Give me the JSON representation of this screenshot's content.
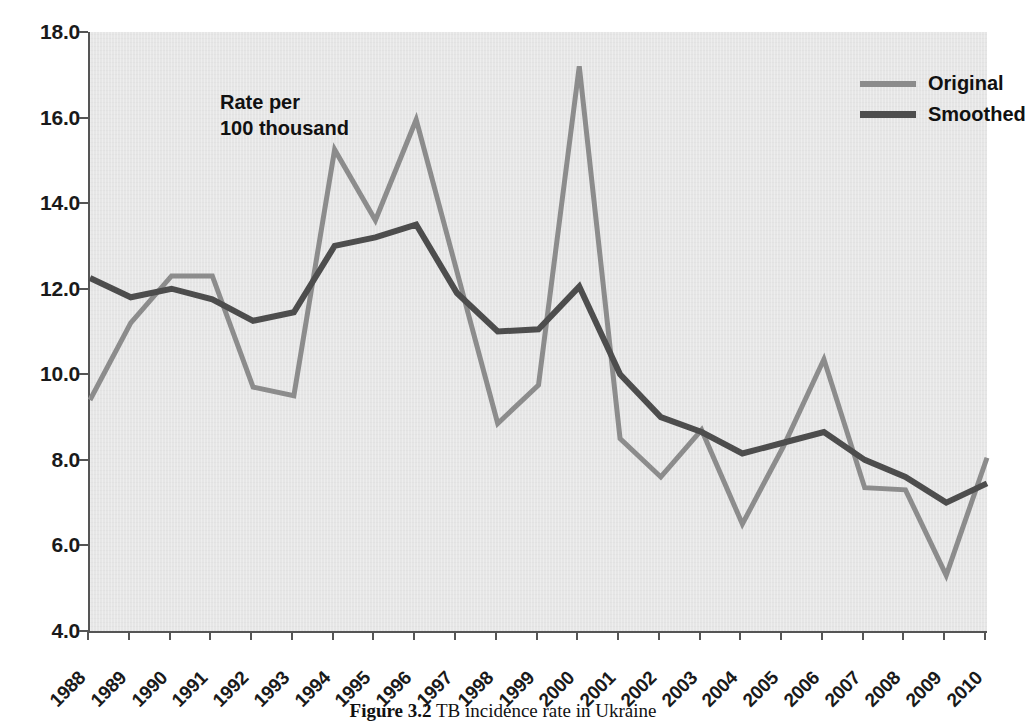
{
  "figure": {
    "annotation": "Rate per\n100 thousand",
    "caption_prefix": "Figure 3.2",
    "caption_text": "TB incidence rate in Ukraine"
  },
  "legend": {
    "position": "top-right",
    "entries": [
      {
        "label": "Original",
        "color": "#8c8c8c"
      },
      {
        "label": "Smoothed",
        "color": "#4d4d4d"
      }
    ]
  },
  "axes": {
    "y_ticks": [
      "4.0",
      "6.0",
      "8.0",
      "10.0",
      "12.0",
      "14.0",
      "16.0",
      "18.0"
    ],
    "x_ticks": [
      "1988",
      "1989",
      "1990",
      "1991",
      "1992",
      "1993",
      "1994",
      "1995",
      "1996",
      "1997",
      "1998",
      "1999",
      "2000",
      "2001",
      "2002",
      "2003",
      "2004",
      "2005",
      "2006",
      "2007",
      "2008",
      "2009",
      "2010"
    ]
  },
  "chart_data": {
    "type": "line",
    "title": "",
    "xlabel": "",
    "ylabel": "Rate per 100 thousand",
    "ylim": [
      4.0,
      18.0
    ],
    "ytick_step": 2.0,
    "grid": false,
    "legend_position": "top-right",
    "categories": [
      "1988",
      "1989",
      "1990",
      "1991",
      "1992",
      "1993",
      "1994",
      "1995",
      "1996",
      "1997",
      "1998",
      "1999",
      "2000",
      "2001",
      "2002",
      "2003",
      "2004",
      "2005",
      "2006",
      "2007",
      "2008",
      "2009",
      "2010"
    ],
    "x": [
      1988,
      1989,
      1990,
      1991,
      1992,
      1993,
      1994,
      1995,
      1996,
      1997,
      1998,
      1999,
      2000,
      2001,
      2002,
      2003,
      2004,
      2005,
      2006,
      2007,
      2008,
      2009,
      2010
    ],
    "series": [
      {
        "name": "Original",
        "color": "#8c8c8c",
        "values": [
          9.4,
          11.2,
          12.3,
          12.3,
          9.7,
          9.5,
          15.25,
          13.6,
          15.95,
          12.4,
          8.85,
          9.75,
          17.2,
          8.5,
          7.6,
          8.7,
          6.5,
          8.3,
          10.35,
          7.35,
          7.3,
          5.3,
          8.05
        ]
      },
      {
        "name": "Smoothed",
        "color": "#4d4d4d",
        "values": [
          12.25,
          11.8,
          12.0,
          11.75,
          11.25,
          11.45,
          13.0,
          13.2,
          13.5,
          11.9,
          11.0,
          11.05,
          12.05,
          10.0,
          9.0,
          8.65,
          8.15,
          8.4,
          8.65,
          8.0,
          7.6,
          7.0,
          7.45
        ]
      }
    ]
  },
  "style": {
    "plot_background": "#e6e6e6",
    "axis_color": "#555555",
    "text_color": "#1a1a1a"
  }
}
